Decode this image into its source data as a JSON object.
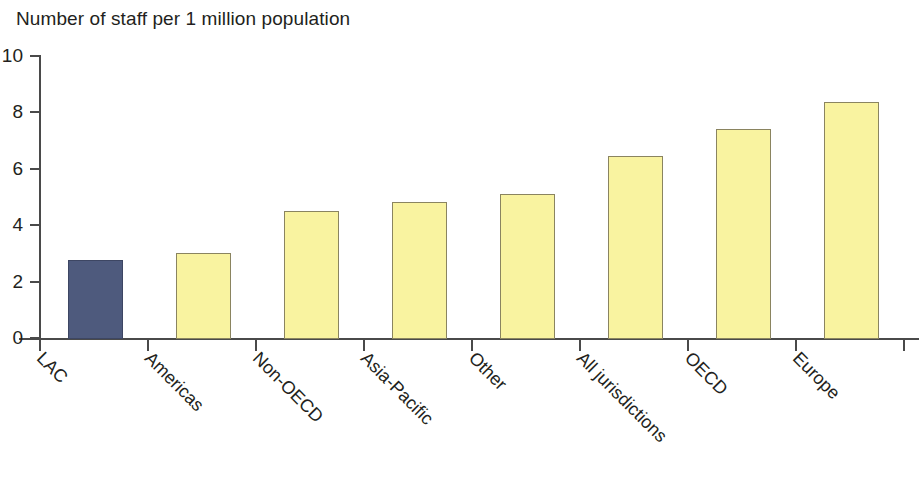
{
  "chart_data": {
    "type": "bar",
    "title": "Number of staff per 1 million population",
    "xlabel": "",
    "ylabel": "",
    "ylim": [
      0,
      10
    ],
    "yticks": [
      0,
      2,
      4,
      6,
      8,
      10
    ],
    "grid": false,
    "legend": false,
    "categories": [
      "LAC",
      "Americas",
      "Non-OECD",
      "Asia-Pacific",
      "Other",
      "All jurisdictions",
      "OECD",
      "Europe"
    ],
    "values": [
      2.8,
      3.05,
      4.55,
      4.85,
      5.15,
      6.5,
      7.45,
      8.4
    ],
    "colors": {
      "highlight": "#4e5a7d",
      "default": "#f9f3a0",
      "highlight_border": "#3d4663",
      "default_border": "#8a8460",
      "axis": "#4a4a4a",
      "text": "#231f20",
      "background": "#ffffff"
    },
    "bar_colors": [
      "#4e5a7d",
      "#f9f3a0",
      "#f9f3a0",
      "#f9f3a0",
      "#f9f3a0",
      "#f9f3a0",
      "#f9f3a0",
      "#f9f3a0"
    ]
  }
}
